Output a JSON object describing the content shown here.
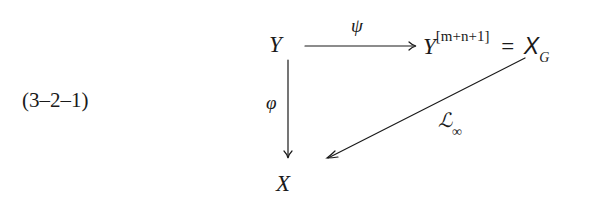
{
  "equation_number": "(3–2–1)",
  "nodes": {
    "top_left": "Y",
    "top_right_base": "Y",
    "top_right_superscript": "[m+n+1]",
    "top_right_equals": "=",
    "top_right_rhs_base": "X",
    "top_right_rhs_subscript": "G",
    "bottom_left": "X"
  },
  "arrows": {
    "horizontal_label": "ψ",
    "vertical_label": "φ",
    "diagonal_label_base": "ℒ",
    "diagonal_label_subscript": "∞"
  },
  "colors": {
    "ink": "#1a1a1a",
    "background": "#ffffff"
  }
}
